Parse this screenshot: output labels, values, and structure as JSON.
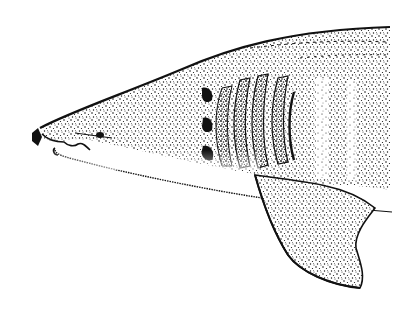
{
  "illustration": {
    "subject": "basking shark head, lateral view",
    "style": "black ink stipple drawing on white",
    "colors": {
      "background": "#ffffff",
      "ink": "#111111",
      "belly": "#ffffff"
    },
    "features": {
      "gill_slits": 5,
      "eye": true,
      "pectoral_fin": true,
      "nostril_marker": true
    }
  }
}
